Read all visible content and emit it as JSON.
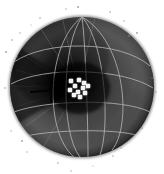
{
  "figure": {
    "title": "Grayscale volumetric sphere render with polar grid and bright point cluster",
    "background_color": "#ffffff",
    "width": 164,
    "height": 174,
    "colormap": "grayscale"
  },
  "sphere": {
    "name": "dark-sphere-body",
    "center_x": 82,
    "center_y": 87,
    "radius_x": 72,
    "radius_y": 70,
    "limb_color": "#0a0a0a",
    "mid_color": "#3c3c3c",
    "bright_color": "#585858",
    "core_color": "#070707",
    "rim_highlight_color": "#6a6a6a"
  },
  "graticule": {
    "name": "lat-lon-grid",
    "line_color": "#b9b9b9",
    "line_width": 0.9,
    "meridian_count": 5,
    "parallel_count": 4,
    "meridians": [
      "m-left-outer",
      "m-left-inner",
      "m-center",
      "m-right-inner",
      "m-right-outer"
    ],
    "parallels": [
      "p-upper",
      "p-mid-upper",
      "p-mid-lower",
      "p-lower"
    ]
  },
  "vortex": {
    "name": "central-funnel",
    "apex_x": 78,
    "apex_y": 88,
    "streak_color": "#9a9a9a",
    "dark_core_color": "#030303",
    "radial_streak_count": 9,
    "horizontal_jet": {
      "name": "dark-jet-streak",
      "x1": 30,
      "y1": 92,
      "x2": 77,
      "y2": 89,
      "color": "#050505"
    }
  },
  "point_cluster": {
    "name": "bright-point-cluster",
    "color": "#f4f4f4",
    "point_size": 4,
    "count": 11,
    "points": [
      {
        "id": "pt-1",
        "x": 71,
        "y": 81
      },
      {
        "id": "pt-2",
        "x": 79,
        "y": 80
      },
      {
        "id": "pt-3",
        "x": 84,
        "y": 83
      },
      {
        "id": "pt-4",
        "x": 75,
        "y": 86
      },
      {
        "id": "pt-5",
        "x": 83,
        "y": 88
      },
      {
        "id": "pt-6",
        "x": 70,
        "y": 90
      },
      {
        "id": "pt-7",
        "x": 78,
        "y": 92
      },
      {
        "id": "pt-8",
        "x": 85,
        "y": 93
      },
      {
        "id": "pt-9",
        "x": 74,
        "y": 95
      },
      {
        "id": "pt-10",
        "x": 80,
        "y": 97
      },
      {
        "id": "pt-11",
        "x": 88,
        "y": 86
      }
    ]
  },
  "starfield": {
    "name": "background-speckles",
    "color": "#9e9e9e",
    "count": 24,
    "stars": [
      {
        "id": "star-1",
        "x": 12,
        "y": 40,
        "r": 0.8
      },
      {
        "id": "star-2",
        "x": 20,
        "y": 33,
        "r": 0.7
      },
      {
        "id": "star-3",
        "x": 6,
        "y": 52,
        "r": 0.9
      },
      {
        "id": "star-4",
        "x": 17,
        "y": 57,
        "r": 0.6
      },
      {
        "id": "star-5",
        "x": 5,
        "y": 88,
        "r": 0.8
      },
      {
        "id": "star-6",
        "x": 11,
        "y": 131,
        "r": 0.7
      },
      {
        "id": "star-7",
        "x": 22,
        "y": 141,
        "r": 0.9
      },
      {
        "id": "star-8",
        "x": 27,
        "y": 152,
        "r": 0.7
      },
      {
        "id": "star-9",
        "x": 58,
        "y": 163,
        "r": 0.8
      },
      {
        "id": "star-10",
        "x": 71,
        "y": 171,
        "r": 0.7
      },
      {
        "id": "star-11",
        "x": 93,
        "y": 166,
        "r": 0.6
      },
      {
        "id": "star-12",
        "x": 113,
        "y": 156,
        "r": 0.8
      },
      {
        "id": "star-13",
        "x": 121,
        "y": 148,
        "r": 0.7
      },
      {
        "id": "star-14",
        "x": 142,
        "y": 128,
        "r": 0.9
      },
      {
        "id": "star-15",
        "x": 156,
        "y": 92,
        "r": 0.8
      },
      {
        "id": "star-16",
        "x": 152,
        "y": 78,
        "r": 0.6
      },
      {
        "id": "star-17",
        "x": 137,
        "y": 33,
        "r": 0.9
      },
      {
        "id": "star-18",
        "x": 129,
        "y": 36,
        "r": 0.7
      },
      {
        "id": "star-19",
        "x": 124,
        "y": 21,
        "r": 0.7
      },
      {
        "id": "star-20",
        "x": 110,
        "y": 12,
        "r": 0.8
      },
      {
        "id": "star-21",
        "x": 78,
        "y": 7,
        "r": 0.9
      },
      {
        "id": "star-22",
        "x": 66,
        "y": 9,
        "r": 0.7
      },
      {
        "id": "star-23",
        "x": 40,
        "y": 18,
        "r": 0.8
      },
      {
        "id": "star-24",
        "x": 31,
        "y": 25,
        "r": 0.6
      }
    ]
  },
  "chart_data": {
    "type": "scatter",
    "title": "Grayscale volumetric sphere render with polar grid and bright point cluster",
    "xlabel": "",
    "ylabel": "",
    "xlim": [
      0,
      164
    ],
    "ylim": [
      174,
      0
    ],
    "grid": true,
    "legend": false,
    "series": [
      {
        "name": "bright-point-cluster",
        "marker": "square",
        "color": "#f4f4f4",
        "x": [
          71,
          79,
          84,
          75,
          83,
          70,
          78,
          85,
          74,
          80,
          88
        ],
        "y": [
          81,
          80,
          83,
          86,
          88,
          90,
          92,
          93,
          95,
          97,
          86
        ]
      },
      {
        "name": "background-speckles",
        "marker": "dot",
        "color": "#9e9e9e",
        "x": [
          12,
          20,
          6,
          17,
          5,
          11,
          22,
          27,
          58,
          71,
          93,
          113,
          121,
          142,
          156,
          152,
          137,
          129,
          124,
          110,
          78,
          66,
          40,
          31
        ],
        "y": [
          40,
          33,
          52,
          57,
          88,
          131,
          141,
          152,
          163,
          171,
          166,
          156,
          148,
          128,
          92,
          78,
          33,
          36,
          21,
          12,
          7,
          9,
          18,
          25
        ]
      }
    ],
    "annotations": [
      {
        "name": "dark-jet-streak",
        "x1": 30,
        "y1": 92,
        "x2": 77,
        "y2": 89
      },
      {
        "name": "sphere-limb",
        "cx": 82,
        "cy": 87,
        "rx": 72,
        "ry": 70
      }
    ]
  }
}
